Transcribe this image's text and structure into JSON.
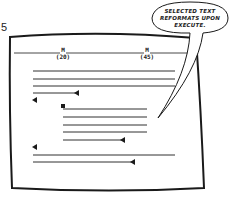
{
  "figure": {
    "number": "5"
  },
  "ruler": {
    "margins": [
      {
        "label": "M",
        "value": "(20)"
      },
      {
        "label": "M",
        "value": "(45)"
      }
    ]
  },
  "callout": {
    "lines": [
      "SELECTED TEXT",
      "REFORMATS UPON",
      "EXECUTE."
    ]
  },
  "screen": {
    "paragraphs": [
      {
        "indent": "left",
        "lines": 4,
        "end_marker": "arrow-left"
      },
      {
        "indent": "indented",
        "selected": true,
        "start_marker": "block-cursor",
        "lines": 5,
        "end_marker": "arrow-left"
      },
      {
        "indent": "left",
        "lines": 2,
        "end_marker": "arrow-left"
      }
    ]
  },
  "colors": {
    "ink": "#1a1a1a",
    "paper": "#ffffff"
  }
}
